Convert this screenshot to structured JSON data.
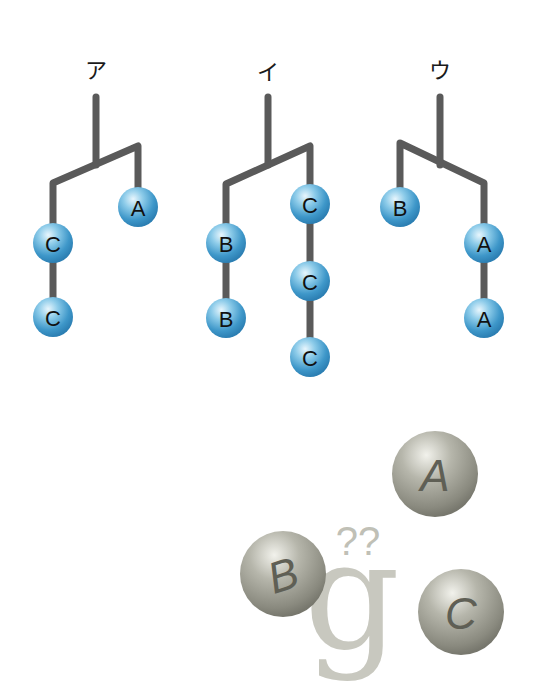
{
  "trees": [
    {
      "label": "ア",
      "nodes": [
        {
          "letter": "C",
          "x": 53,
          "y": 243
        },
        {
          "letter": "C",
          "x": 53,
          "y": 317
        },
        {
          "letter": "A",
          "x": 138,
          "y": 207
        }
      ]
    },
    {
      "label": "イ",
      "nodes": [
        {
          "letter": "B",
          "x": 226,
          "y": 243
        },
        {
          "letter": "B",
          "x": 226,
          "y": 318
        },
        {
          "letter": "C",
          "x": 310,
          "y": 204
        },
        {
          "letter": "C",
          "x": 310,
          "y": 281
        },
        {
          "letter": "C",
          "x": 310,
          "y": 357
        }
      ]
    },
    {
      "label": "ウ",
      "nodes": [
        {
          "letter": "B",
          "x": 400,
          "y": 207
        },
        {
          "letter": "A",
          "x": 484,
          "y": 243
        },
        {
          "letter": "A",
          "x": 484,
          "y": 318
        }
      ]
    }
  ],
  "illustration": {
    "spheres": [
      {
        "letter": "A",
        "x": 435,
        "y": 474
      },
      {
        "letter": "B",
        "x": 283,
        "y": 574
      },
      {
        "letter": "C",
        "x": 461,
        "y": 612
      }
    ],
    "glyph": "g",
    "question_marks": "??"
  },
  "colors": {
    "node_fill": "#4aa3d4",
    "branch": "#5a5a5a",
    "gray_sphere": "#9a9a8e"
  }
}
